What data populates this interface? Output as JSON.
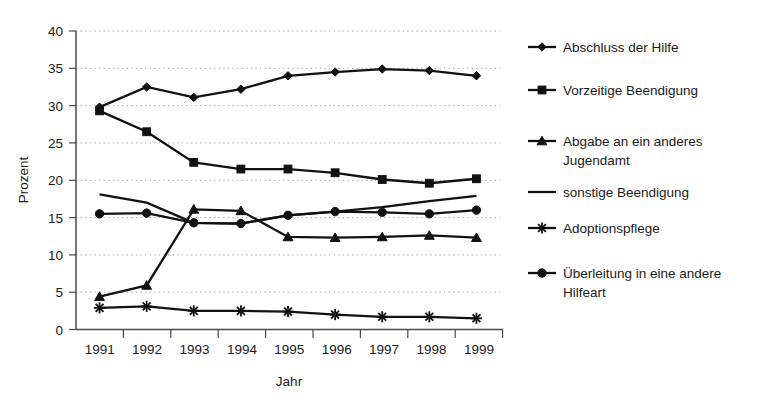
{
  "chart_data": {
    "type": "line",
    "title": "",
    "subtitle": "",
    "xlabel": "Jahr",
    "ylabel": "Prozent",
    "categories": [
      "1991",
      "1992",
      "1993",
      "1994",
      "1995",
      "1996",
      "1997",
      "1998",
      "1999"
    ],
    "x": [
      1991,
      1992,
      1993,
      1994,
      1995,
      1996,
      1997,
      1998,
      1999
    ],
    "ylim": [
      0,
      40
    ],
    "yticks": [
      0,
      5,
      10,
      15,
      20,
      25,
      30,
      35,
      40
    ],
    "grid": "horizontal-dotted",
    "legend_position": "right",
    "series": [
      {
        "name": "Abschluss der Hilfe",
        "marker": "diamond",
        "values": [
          29.8,
          32.5,
          31.1,
          32.2,
          34.0,
          34.5,
          34.9,
          34.7,
          34.0
        ]
      },
      {
        "name": "Vorzeitige Beendigung",
        "marker": "square",
        "values": [
          29.3,
          26.5,
          22.4,
          21.5,
          21.5,
          21.0,
          20.1,
          19.6,
          20.2
        ]
      },
      {
        "name": "Abgabe an ein anderes Jugendamt",
        "marker": "triangle",
        "values": [
          4.4,
          5.9,
          16.1,
          15.9,
          12.4,
          12.3,
          12.4,
          12.6,
          12.3
        ]
      },
      {
        "name": "sonstige Beendigung",
        "marker": "none",
        "values": [
          18.1,
          17.0,
          14.3,
          14.2,
          15.3,
          15.8,
          16.4,
          17.2,
          17.9
        ]
      },
      {
        "name": "Adoptionspflege",
        "marker": "star",
        "values": [
          2.9,
          3.1,
          2.5,
          2.5,
          2.4,
          2.0,
          1.7,
          1.7,
          1.5
        ]
      },
      {
        "name": "Überleitung in eine andere Hilfeart",
        "marker": "circle",
        "values": [
          15.5,
          15.6,
          14.3,
          14.2,
          15.3,
          15.8,
          15.7,
          15.5,
          16.0
        ]
      }
    ]
  },
  "legend": {
    "items": [
      {
        "label": "Abschluss der Hilfe",
        "marker": "diamond"
      },
      {
        "label": "Vorzeitige Beendigung",
        "marker": "square"
      },
      {
        "label": "Abgabe an ein anderes",
        "label2": "Jugendamt",
        "marker": "triangle"
      },
      {
        "label": "sonstige Beendigung",
        "marker": "none"
      },
      {
        "label": "Adoptionspflege",
        "marker": "star"
      },
      {
        "label": "Überleitung in eine andere",
        "label2": "Hilfeart",
        "marker": "circle"
      }
    ]
  },
  "axes": {
    "y_title": "Prozent",
    "x_title": "Jahr",
    "y_tick_labels": [
      "40",
      "35",
      "30",
      "25",
      "20",
      "15",
      "10",
      "5",
      "0"
    ],
    "x_tick_labels": [
      "1991",
      "1992",
      "1993",
      "1994",
      "1995",
      "1996",
      "1997",
      "1998",
      "1999"
    ]
  },
  "colors": {
    "ink": "#111111",
    "grid": "#9a9a9a",
    "axis": "#4a4a4a",
    "background": "#ffffff"
  }
}
